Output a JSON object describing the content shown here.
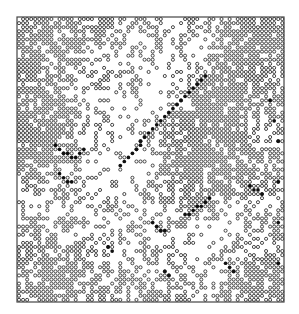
{
  "figure": {
    "type": "lattice-configuration",
    "background": "#ffffff",
    "ink_color": "#333333",
    "filled_color": "#111111",
    "frame": {
      "x": 17,
      "y": 17,
      "width": 267,
      "height": 285,
      "stroke": "#444444",
      "stroke_width": 1.2
    },
    "grid": {
      "cols": 66,
      "rows": 70,
      "cell_w": 4.05,
      "cell_h": 4.07
    },
    "site_marker": "open-circle",
    "site_radius": 1.55,
    "density_map": {
      "block_cols": 11,
      "block_rows": 10,
      "values": [
        [
          0.85,
          0.8,
          0.75,
          0.7,
          0.55,
          0.4,
          0.3,
          0.3,
          0.75,
          0.85,
          0.85
        ],
        [
          0.85,
          0.7,
          0.55,
          0.45,
          0.3,
          0.2,
          0.18,
          0.35,
          0.85,
          0.88,
          0.85
        ],
        [
          0.85,
          0.75,
          0.4,
          0.3,
          0.25,
          0.15,
          0.25,
          0.8,
          0.88,
          0.85,
          0.8
        ],
        [
          0.85,
          0.8,
          0.55,
          0.35,
          0.2,
          0.2,
          0.75,
          0.88,
          0.85,
          0.75,
          0.7
        ],
        [
          0.88,
          0.85,
          0.45,
          0.25,
          0.15,
          0.45,
          0.85,
          0.88,
          0.8,
          0.7,
          0.7
        ],
        [
          0.75,
          0.5,
          0.3,
          0.25,
          0.2,
          0.4,
          0.8,
          0.85,
          0.85,
          0.8,
          0.75
        ],
        [
          0.35,
          0.3,
          0.3,
          0.25,
          0.25,
          0.35,
          0.45,
          0.7,
          0.6,
          0.4,
          0.45
        ],
        [
          0.55,
          0.5,
          0.45,
          0.35,
          0.3,
          0.4,
          0.35,
          0.25,
          0.2,
          0.3,
          0.5
        ],
        [
          0.8,
          0.75,
          0.65,
          0.5,
          0.3,
          0.45,
          0.45,
          0.3,
          0.35,
          0.7,
          0.8
        ],
        [
          0.85,
          0.8,
          0.7,
          0.55,
          0.45,
          0.5,
          0.5,
          0.4,
          0.65,
          0.85,
          0.88
        ]
      ]
    },
    "boundary_filled_sites": [
      [
        46,
        14
      ],
      [
        45,
        15
      ],
      [
        44,
        16
      ],
      [
        43,
        17
      ],
      [
        42,
        18
      ],
      [
        41,
        19
      ],
      [
        40,
        20
      ],
      [
        39,
        21
      ],
      [
        38,
        22
      ],
      [
        37,
        23
      ],
      [
        36,
        24
      ],
      [
        35,
        25
      ],
      [
        34,
        26
      ],
      [
        33,
        27
      ],
      [
        32,
        28
      ],
      [
        31,
        29
      ],
      [
        30,
        30
      ],
      [
        30,
        31
      ],
      [
        29,
        32
      ],
      [
        28,
        33
      ],
      [
        27,
        34
      ],
      [
        26,
        35
      ],
      [
        25,
        36
      ],
      [
        9,
        31
      ],
      [
        10,
        32
      ],
      [
        11,
        33
      ],
      [
        12,
        33
      ],
      [
        13,
        34
      ],
      [
        14,
        34
      ],
      [
        15,
        33
      ],
      [
        16,
        32
      ],
      [
        10,
        38
      ],
      [
        11,
        39
      ],
      [
        12,
        40
      ],
      [
        13,
        40
      ],
      [
        47,
        44
      ],
      [
        46,
        45
      ],
      [
        45,
        46
      ],
      [
        44,
        46
      ],
      [
        43,
        47
      ],
      [
        42,
        48
      ],
      [
        41,
        48
      ],
      [
        33,
        50
      ],
      [
        34,
        51
      ],
      [
        35,
        52
      ],
      [
        36,
        52
      ],
      [
        62,
        20
      ],
      [
        63,
        25
      ],
      [
        64,
        30
      ],
      [
        64,
        40
      ],
      [
        64,
        50
      ],
      [
        64,
        60
      ],
      [
        57,
        41
      ],
      [
        58,
        42
      ],
      [
        59,
        42
      ],
      [
        60,
        43
      ],
      [
        22,
        56
      ],
      [
        23,
        57
      ],
      [
        36,
        62
      ],
      [
        37,
        63
      ],
      [
        51,
        60
      ],
      [
        52,
        61
      ],
      [
        53,
        62
      ]
    ],
    "rng_seed": 1729
  }
}
